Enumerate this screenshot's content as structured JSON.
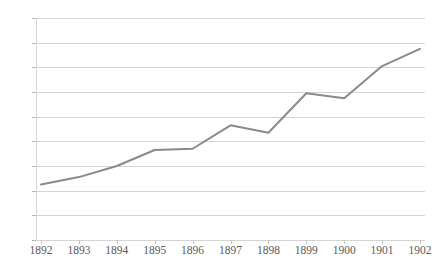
{
  "chart_data": {
    "type": "line",
    "title": "",
    "subtitle": "",
    "xlabel": "",
    "ylabel": "",
    "categories": [
      "1892",
      "1893",
      "1894",
      "1895",
      "1896",
      "1897",
      "1898",
      "1899",
      "1900",
      "1901",
      "1902"
    ],
    "series": [
      {
        "name": "series-1",
        "values": [
          45,
          51,
          60,
          73,
          74,
          93,
          87,
          119,
          115,
          141,
          155
        ],
        "color": "#8a8a8a",
        "line_width": 2,
        "markers": false
      }
    ],
    "ylim": [
      0,
      180
    ],
    "ytick_step": 20,
    "yticks": [
      0,
      20,
      40,
      60,
      80,
      100,
      120,
      140,
      160,
      180
    ],
    "ytick_labels": [
      "0",
      "20",
      "40",
      "60",
      "80",
      "100",
      "120",
      "140",
      "160",
      "180"
    ],
    "grid": {
      "horizontal": true,
      "vertical": false,
      "color": "#d4d4d4"
    },
    "legend": {
      "visible": false,
      "position": "none"
    },
    "annotations": [],
    "background_color": "#ffffff",
    "axis_color": "#d4d4d4",
    "label_color": "#5a5a5a"
  }
}
